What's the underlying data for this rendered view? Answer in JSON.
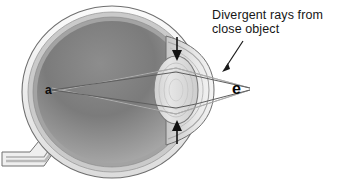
{
  "figure": {
    "background_color": "#ffffff"
  },
  "annotations": {
    "caption": {
      "line1": "Divergent rays from",
      "line2": "close object",
      "color": "#161616"
    },
    "point_labels": [
      {
        "id": "a",
        "text": "a",
        "meaning": "image focus point on retina",
        "color": "#0d0d0d"
      },
      {
        "id": "e",
        "text": "e",
        "meaning": "close object point source",
        "color": "#060606"
      }
    ],
    "leader_line": {
      "name": "caption-leader-line",
      "from": [
        243,
        42
      ],
      "to": [
        223,
        69
      ],
      "color": "#1a1a1a"
    }
  },
  "eye_parts": {
    "sclera": {
      "label": "sclera",
      "color": "#f2f2f2",
      "stroke": "#6e6e6e"
    },
    "choroid": {
      "label": "choroid",
      "color": "#c9c9c9"
    },
    "retina": {
      "label": "retina",
      "color": "#9a9a9a"
    },
    "vitreous_body": {
      "label": "vitreous body",
      "color_top": "#6f6f6f",
      "color_bottom": "#a8a8a8"
    },
    "lens": {
      "label": "lens",
      "color": "#d8d8d8",
      "stroke": "#8a8a8a"
    },
    "cornea": {
      "label": "cornea",
      "color": "#e4e4e4",
      "stroke": "#7c7c7c"
    },
    "anterior_chamber": {
      "label": "anterior chamber",
      "color": "#dddddd"
    },
    "optic_nerve": {
      "label": "optic nerve",
      "color": "#e6e6e6",
      "stroke": "#6e6e6e"
    },
    "ciliary_arrows": {
      "label": "ciliary muscle contraction arrows",
      "top": {
        "direction": "down",
        "x": 177,
        "y_start": 38,
        "y_end": 59
      },
      "bottom": {
        "direction": "up",
        "x": 177,
        "y_start": 140,
        "y_end": 119
      },
      "color": "#111111"
    }
  },
  "light_rays": {
    "color": "#ffffff",
    "stroke": "#5a5a5a",
    "description": "Two divergent rays travel from point e, refract through the lens, and converge at point a on the retina",
    "source_point": [
      250,
      88
    ],
    "focus_point": [
      52,
      90
    ]
  }
}
